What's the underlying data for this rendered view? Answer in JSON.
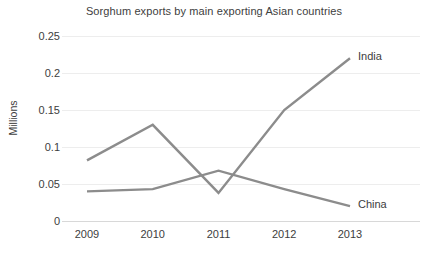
{
  "chart_data": {
    "type": "line",
    "title": "Sorghum exports by main exporting Asian countries",
    "xlabel": "",
    "ylabel": "Millions",
    "categories": [
      "2009",
      "2010",
      "2011",
      "2012",
      "2013"
    ],
    "x": [
      2009,
      2010,
      2011,
      2012,
      2013
    ],
    "series": [
      {
        "name": "India",
        "values": [
          0.082,
          0.13,
          0.038,
          0.15,
          0.22
        ],
        "color": "#8c8c8c",
        "label_position": "right-top"
      },
      {
        "name": "China",
        "values": [
          0.04,
          0.043,
          0.068,
          0.043,
          0.02
        ],
        "color": "#8c8c8c",
        "label_position": "right-bottom"
      }
    ],
    "ylim": [
      0,
      0.25
    ],
    "yticks": [
      0,
      0.05,
      0.1,
      0.15,
      0.2,
      0.25
    ],
    "ytick_labels": [
      "0",
      "0.05",
      "0.1",
      "0.15",
      "0.2",
      "0.25"
    ],
    "grid": true,
    "grid_axis": "y",
    "grid_color": "#ededed",
    "legend": "inline-series-labels",
    "background_color": "#ffffff",
    "line_color": "#8c8c8c",
    "text_color": "#3d3d3d"
  }
}
